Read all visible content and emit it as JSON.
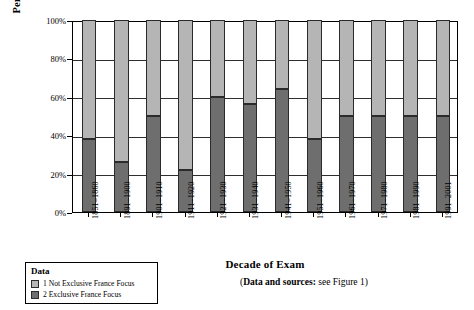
{
  "chart_data": {
    "type": "bar",
    "stacked": true,
    "title": "",
    "xlabel": "Decade of Exam",
    "ylabel": "Percent of total exam questions",
    "ylim": [
      0,
      100
    ],
    "yticks": [
      "0%",
      "20%",
      "40%",
      "60%",
      "80%",
      "100%"
    ],
    "ytick_values": [
      0,
      20,
      40,
      60,
      80,
      100
    ],
    "grid": true,
    "unit": "percent",
    "categories": [
      "1851–1860",
      "1891–1900",
      "1901–1910",
      "1911–1920",
      "1921–1930",
      "1931–1940",
      "1941–1950",
      "1951–1960",
      "1961–1970",
      "1971–1980",
      "1981–1990",
      "1991–2001"
    ],
    "series": [
      {
        "name": "2 Exclusive France Focus",
        "color": "#6e6e6e",
        "values": [
          38,
          26,
          50,
          22,
          60,
          56,
          64,
          38,
          50,
          50,
          50,
          50
        ]
      },
      {
        "name": "1 Not Exclusive France Focus",
        "color": "#b5b5b5",
        "values": [
          62,
          74,
          50,
          78,
          40,
          44,
          36,
          62,
          50,
          50,
          50,
          50
        ]
      }
    ],
    "legend_position": "below-left"
  },
  "legend": {
    "title": "Data",
    "items": [
      {
        "label": "1 Not Exclusive France Focus",
        "color": "#b5b5b5"
      },
      {
        "label": "2 Exclusive France Focus",
        "color": "#6e6e6e"
      }
    ]
  },
  "caption": {
    "bold_part": "Data and sources:",
    "rest_part": " see Figure 1)",
    "open_paren": "("
  }
}
